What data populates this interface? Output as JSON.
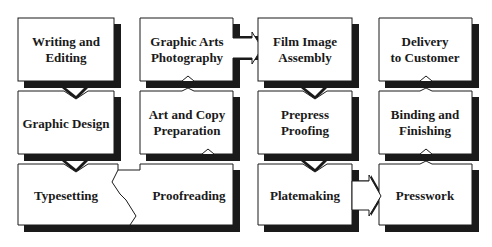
{
  "colors": {
    "box_fill": "#ffffff",
    "outline": "#1a1a1a",
    "shadow": "#1a1a1a"
  },
  "boxes": [
    {
      "id": "writing",
      "lines": [
        "Writing and",
        "Editing"
      ]
    },
    {
      "id": "graphic-arts-photo",
      "lines": [
        "Graphic Arts",
        "Photography"
      ]
    },
    {
      "id": "film-image",
      "lines": [
        "Film Image",
        "Assembly"
      ]
    },
    {
      "id": "delivery",
      "lines": [
        "Delivery",
        "to Customer"
      ]
    },
    {
      "id": "graphic-design",
      "lines": [
        "Graphic Design"
      ]
    },
    {
      "id": "art-copy",
      "lines": [
        "Art and Copy",
        "Preparation"
      ]
    },
    {
      "id": "prepress",
      "lines": [
        "Prepress",
        "Proofing"
      ]
    },
    {
      "id": "binding",
      "lines": [
        "Binding and",
        "Finishing"
      ]
    },
    {
      "id": "typesetting",
      "lines": [
        "Typesetting"
      ]
    },
    {
      "id": "proofreading",
      "lines": [
        "Proofreading"
      ]
    },
    {
      "id": "platemaking",
      "lines": [
        "Platemaking"
      ]
    },
    {
      "id": "presswork",
      "lines": [
        "Presswork"
      ]
    }
  ],
  "flow": [
    "Writing and Editing -> Graphic Design",
    "Graphic Design -> Typesetting",
    "Typesetting -> Proofreading",
    "Proofreading -> Art and Copy Preparation",
    "Art and Copy Preparation -> Graphic Arts Photography",
    "Graphic Arts Photography -> Film Image Assembly",
    "Film Image Assembly -> Prepress Proofing",
    "Prepress Proofing -> Platemaking",
    "Platemaking -> Presswork",
    "Presswork -> Binding and Finishing",
    "Binding and Finishing -> Delivery to Customer"
  ]
}
